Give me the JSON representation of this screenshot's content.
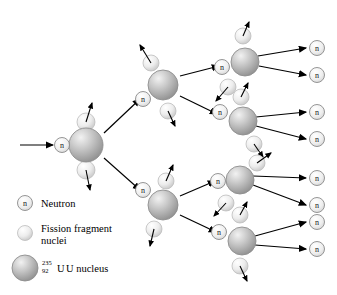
{
  "figure": {
    "background_color": "#ffffff",
    "line_color": "#000000"
  },
  "legend": {
    "items": [
      {
        "key": "neutron",
        "label": "Neutron",
        "glyph": "n",
        "icon": "neutron-circle-icon",
        "color": "#e8e8e8"
      },
      {
        "key": "fragment",
        "label": "Fission fragment",
        "label_line2": "nuclei",
        "icon": "fission-fragment-icon",
        "color": "#ededed"
      },
      {
        "key": "uranium",
        "label": "U nucleus",
        "mass_number": "235",
        "atomic_number": "92",
        "element": "U",
        "icon": "uranium-nucleus-icon",
        "color": "#b4b4b4"
      }
    ]
  },
  "chart_data": {
    "type": "diagram",
    "generations": 3,
    "nuclei_per_generation": [
      1,
      2,
      4
    ],
    "free_neutrons_emitted": 8,
    "incident_neutrons": 1,
    "neutron_glyph": "n",
    "nuclei": [
      {
        "id": "u1",
        "generation": 1,
        "x": 86,
        "y": 145,
        "r": 17,
        "neutron_label": {
          "x": 62,
          "y": 145
        },
        "fragments": [
          {
            "x": 86,
            "y": 122,
            "r": 9,
            "recoil": [
              92,
              103
            ]
          },
          {
            "x": 86,
            "y": 170,
            "r": 9,
            "recoil": [
              90,
              190
            ]
          }
        ]
      },
      {
        "id": "u2a",
        "generation": 2,
        "x": 163,
        "y": 85,
        "r": 15,
        "neutron_label": {
          "x": 143,
          "y": 99
        },
        "fragments": [
          {
            "x": 151,
            "y": 63,
            "r": 8,
            "recoil": [
              140,
              45
            ]
          },
          {
            "x": 168,
            "y": 111,
            "r": 8,
            "recoil": [
              175,
              126
            ]
          }
        ]
      },
      {
        "id": "u2b",
        "generation": 2,
        "x": 163,
        "y": 205,
        "r": 15,
        "neutron_label": {
          "x": 143,
          "y": 190
        },
        "fragments": [
          {
            "x": 166,
            "y": 181,
            "r": 8,
            "recoil": [
              173,
              165
            ]
          },
          {
            "x": 154,
            "y": 229,
            "r": 8,
            "recoil": [
              150,
              246
            ]
          }
        ]
      },
      {
        "id": "u3a",
        "generation": 3,
        "x": 245,
        "y": 62,
        "r": 14,
        "neutron_label": {
          "x": 222,
          "y": 67
        },
        "fragments": [
          {
            "x": 243,
            "y": 36,
            "r": 8,
            "recoil": [
              249,
              22
            ]
          },
          {
            "x": 228,
            "y": 87,
            "r": 8,
            "recoil": [
              216,
              101
            ]
          }
        ]
      },
      {
        "id": "u3b",
        "generation": 3,
        "x": 243,
        "y": 121,
        "r": 14,
        "neutron_label": {
          "x": 220,
          "y": 112
        },
        "fragments": [
          {
            "x": 241,
            "y": 97,
            "r": 8,
            "recoil": [
              248,
              83
            ]
          },
          {
            "x": 254,
            "y": 144,
            "r": 8,
            "recoil": [
              263,
              157
            ]
          }
        ]
      },
      {
        "id": "u3c",
        "generation": 3,
        "x": 240,
        "y": 180,
        "r": 14,
        "neutron_label": {
          "x": 218,
          "y": 181
        },
        "fragments": [
          {
            "x": 257,
            "y": 163,
            "r": 8,
            "recoil": [
              271,
              153
            ]
          },
          {
            "x": 226,
            "y": 203,
            "r": 8,
            "recoil": [
              214,
              216
            ]
          }
        ]
      },
      {
        "id": "u3d",
        "generation": 3,
        "x": 242,
        "y": 241,
        "r": 14,
        "neutron_label": {
          "x": 219,
          "y": 232
        },
        "fragments": [
          {
            "x": 240,
            "y": 215,
            "r": 8,
            "recoil": [
              247,
              202
            ]
          },
          {
            "x": 240,
            "y": 266,
            "r": 8,
            "recoil": [
              247,
              281
            ]
          }
        ]
      }
    ],
    "free_neutrons": [
      {
        "x": 317,
        "y": 48
      },
      {
        "x": 317,
        "y": 75
      },
      {
        "x": 317,
        "y": 112
      },
      {
        "x": 317,
        "y": 139
      },
      {
        "x": 317,
        "y": 178
      },
      {
        "x": 317,
        "y": 205
      },
      {
        "x": 317,
        "y": 222
      },
      {
        "x": 317,
        "y": 249
      }
    ],
    "incident_arrow": {
      "x1": 20,
      "y1": 145,
      "x2": 55,
      "y2": 145
    }
  }
}
